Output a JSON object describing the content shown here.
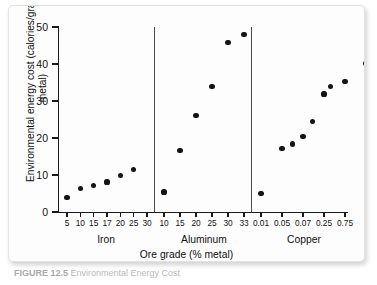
{
  "figure": {
    "caption_label": "FIGURE 12.5",
    "caption_text": "Environmental Energy Cost"
  },
  "chart_data": {
    "type": "scatter",
    "title": "",
    "xlabel": "Ore grade (% metal)",
    "ylabel": "Environmental energy cost (calories/gram metal)",
    "ylim": [
      0,
      50
    ],
    "yticks": [
      0,
      10,
      20,
      30,
      40,
      50
    ],
    "grid": false,
    "legend": "none",
    "panel_layout": "three side-by-side panels sharing one y-axis, separated by vertical rules",
    "panels": [
      {
        "name": "Iron",
        "xticklabels": [
          "5",
          "10",
          "15",
          "17",
          "20",
          "25",
          "30"
        ],
        "points": [
          {
            "x": "5",
            "y": 4.0
          },
          {
            "x": "10",
            "y": 6.3
          },
          {
            "x": "15",
            "y": 7.2
          },
          {
            "x": "17",
            "y": 8.1
          },
          {
            "x": "20",
            "y": 9.9
          },
          {
            "x": "25",
            "y": 11.4
          }
        ],
        "extra_point_note": "7 markers visible; last tick 30 unplotted"
      },
      {
        "name": "Aluminum",
        "xticklabels": [
          "10",
          "15",
          "20",
          "25",
          "30",
          "33"
        ],
        "points": [
          {
            "x": "10",
            "y": 5.4
          },
          {
            "x": "15",
            "y": 16.6
          },
          {
            "x": "20",
            "y": 26.0
          },
          {
            "x": "25",
            "y": 34.0
          },
          {
            "x": "30",
            "y": 45.8
          },
          {
            "x": "33",
            "y": 48.0
          }
        ]
      },
      {
        "name": "Copper",
        "xticklabels": [
          "0.01",
          "0.05",
          "0.07",
          "0.25",
          "0.75"
        ],
        "points": [
          {
            "x": "0.01",
            "y": 5.0
          },
          {
            "x": "0.05",
            "y": 17.1
          },
          {
            "x": "0.06",
            "y": 18.4
          },
          {
            "x": "0.07",
            "y": 20.5
          },
          {
            "x": "0.15",
            "y": 24.4
          },
          {
            "x": "0.25",
            "y": 31.9
          },
          {
            "x": "0.40",
            "y": 34.0
          },
          {
            "x": "0.75",
            "y": 35.3
          },
          {
            "x": "0.90",
            "y": 40.2
          }
        ]
      }
    ]
  }
}
